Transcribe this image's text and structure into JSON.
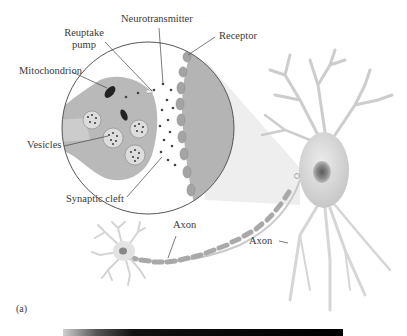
{
  "figure": {
    "panel_label": "(a)",
    "labels": {
      "neurotransmitter": "Neurotransmitter",
      "reuptake_pump_line1": "Reuptake",
      "reuptake_pump_line2": "pump",
      "receptor": "Receptor",
      "mitochondrion": "Mitochondrion",
      "vesicles": "Vesicles",
      "synaptic_cleft": "Synaptic cleft",
      "axon_left": "Axon",
      "axon_right": "Axon"
    },
    "colors": {
      "cell_fill": "#b8b8b8",
      "cell_light": "#d8d8d8",
      "outline": "#555555",
      "dot": "#444444",
      "mito": "#222222",
      "text": "#3a3a3a"
    }
  }
}
